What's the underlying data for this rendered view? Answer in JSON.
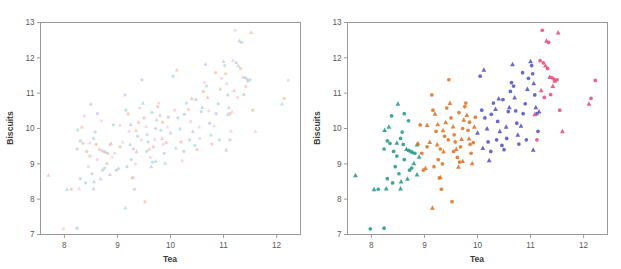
{
  "figure": {
    "background": "#ffffff",
    "frame_color": "#9a9a9a",
    "text_color": "#5a5a5a",
    "panels": [
      {
        "id": "left-panel",
        "name": "unclustered-scatter",
        "marker_style": "faint-multicolor-dots"
      },
      {
        "id": "right-panel",
        "name": "clustered-scatter",
        "marker_style": "solid-colored-circles-and-triangles"
      }
    ]
  },
  "axes": {
    "xlabel": "Tea",
    "ylabel": "Biscuits",
    "xticks": [
      "8",
      "9",
      "10",
      "11",
      "12"
    ],
    "yticks": [
      "7",
      "8",
      "9",
      "10",
      "11",
      "12",
      "13"
    ],
    "xlim": [
      7.55,
      12.45
    ],
    "ylim": [
      7.0,
      13.0
    ]
  },
  "palette": {
    "cluster_green": "#2f9e8f",
    "cluster_orange": "#e07b32",
    "cluster_blue": "#5b5bc4",
    "cluster_pink": "#e8557f",
    "faint_salmon": "#f2a48c",
    "faint_teal": "#8fc9c4",
    "faint_blue": "#a8b4e0",
    "faint_pink": "#f0b9cf"
  },
  "chart_data": {
    "type": "scatter",
    "title": "",
    "xlabel": "Tea",
    "ylabel": "Biscuits",
    "xlim": [
      7.55,
      12.45
    ],
    "ylim": [
      7.0,
      13.0
    ],
    "grid": false,
    "legend": "none",
    "panels": [
      {
        "name": "left",
        "description": "Same points rendered without cluster assignment; faint pastel multicolor small markers",
        "colored_by_cluster": false
      },
      {
        "name": "right",
        "description": "Same points colored by cluster membership; circles and triangles",
        "colored_by_cluster": true
      }
    ],
    "series": [
      {
        "name": "cluster-green",
        "color": "#2f9e8f",
        "faint_color": "#8fc9c4",
        "points": [
          [
            7.7,
            8.68
          ],
          [
            7.98,
            7.16
          ],
          [
            8.24,
            7.18
          ],
          [
            8.05,
            8.28
          ],
          [
            8.13,
            8.28
          ],
          [
            8.28,
            8.3
          ],
          [
            8.24,
            9.42
          ],
          [
            8.3,
            9.65
          ],
          [
            8.33,
            10.05
          ],
          [
            8.38,
            10.36
          ],
          [
            8.5,
            10.7
          ],
          [
            8.55,
            9.72
          ],
          [
            8.42,
            9.35
          ],
          [
            8.48,
            9.6
          ],
          [
            8.52,
            8.72
          ],
          [
            8.56,
            8.5
          ],
          [
            8.6,
            9.55
          ],
          [
            8.62,
            9.12
          ],
          [
            8.55,
            8.3
          ],
          [
            8.4,
            8.46
          ],
          [
            8.66,
            9.42
          ],
          [
            8.7,
            9.38
          ],
          [
            8.74,
            9.35
          ],
          [
            8.78,
            9.33
          ],
          [
            8.82,
            9.3
          ],
          [
            8.86,
            9.55
          ],
          [
            8.72,
            8.82
          ],
          [
            8.76,
            8.88
          ],
          [
            8.8,
            9.02
          ],
          [
            8.45,
            8.92
          ],
          [
            8.68,
            8.58
          ],
          [
            8.58,
            9.9
          ],
          [
            8.35,
            9.58
          ],
          [
            8.9,
            9.2
          ],
          [
            8.62,
            10.42
          ],
          [
            8.25,
            9.96
          ],
          [
            8.48,
            9.22
          ],
          [
            8.7,
            10.22
          ],
          [
            8.86,
            8.7
          ],
          [
            8.3,
            8.58
          ]
        ],
        "shape_mix": "circle+triangle"
      },
      {
        "name": "cluster-orange",
        "color": "#e07b32",
        "faint_color": "#f2a48c",
        "points": [
          [
            8.92,
            10.1
          ],
          [
            8.88,
            9.58
          ],
          [
            8.95,
            9.3
          ],
          [
            8.98,
            8.82
          ],
          [
            9.02,
            8.88
          ],
          [
            9.05,
            9.48
          ],
          [
            9.1,
            9.62
          ],
          [
            9.14,
            10.95
          ],
          [
            9.16,
            10.52
          ],
          [
            9.2,
            10.42
          ],
          [
            9.22,
            9.92
          ],
          [
            9.24,
            9.55
          ],
          [
            9.26,
            9.12
          ],
          [
            9.28,
            8.6
          ],
          [
            9.3,
            8.62
          ],
          [
            9.32,
            8.28
          ],
          [
            9.15,
            7.76
          ],
          [
            9.52,
            7.93
          ],
          [
            9.34,
            9.0
          ],
          [
            9.36,
            9.35
          ],
          [
            9.38,
            9.78
          ],
          [
            9.4,
            10.18
          ],
          [
            9.42,
            10.58
          ],
          [
            9.46,
            11.38
          ],
          [
            9.48,
            10.72
          ],
          [
            9.5,
            10.3
          ],
          [
            9.54,
            10.06
          ],
          [
            9.56,
            9.82
          ],
          [
            9.58,
            9.62
          ],
          [
            9.6,
            9.42
          ],
          [
            9.62,
            9.18
          ],
          [
            9.64,
            8.92
          ],
          [
            9.66,
            9.05
          ],
          [
            9.68,
            9.48
          ],
          [
            9.7,
            9.7
          ],
          [
            9.72,
            10.0
          ],
          [
            9.74,
            10.25
          ],
          [
            9.76,
            10.62
          ],
          [
            9.78,
            10.72
          ],
          [
            9.8,
            10.38
          ],
          [
            9.82,
            9.95
          ],
          [
            9.84,
            9.72
          ],
          [
            9.86,
            9.55
          ],
          [
            9.88,
            9.3
          ],
          [
            9.9,
            9.02
          ],
          [
            9.92,
            9.6
          ],
          [
            9.94,
            10.05
          ],
          [
            9.96,
            10.32
          ],
          [
            9.55,
            9.35
          ],
          [
            9.35,
            9.95
          ],
          [
            9.45,
            9.68
          ],
          [
            9.25,
            10.12
          ],
          [
            9.65,
            10.45
          ],
          [
            9.85,
            10.18
          ],
          [
            9.05,
            10.1
          ],
          [
            9.18,
            8.92
          ],
          [
            9.72,
            9.08
          ],
          [
            9.3,
            9.42
          ]
        ],
        "shape_mix": "circle+triangle"
      },
      {
        "name": "cluster-blue",
        "color": "#5b5bc4",
        "faint_color": "#a8b4e0",
        "points": [
          [
            10.0,
            9.88
          ],
          [
            10.05,
            11.48
          ],
          [
            10.12,
            11.66
          ],
          [
            10.08,
            10.52
          ],
          [
            10.14,
            10.3
          ],
          [
            10.18,
            10.0
          ],
          [
            10.2,
            9.62
          ],
          [
            10.22,
            9.1
          ],
          [
            10.26,
            10.4
          ],
          [
            10.3,
            10.72
          ],
          [
            10.34,
            10.55
          ],
          [
            10.38,
            10.2
          ],
          [
            10.42,
            9.92
          ],
          [
            10.46,
            9.52
          ],
          [
            10.5,
            9.4
          ],
          [
            10.54,
            10.05
          ],
          [
            10.58,
            10.48
          ],
          [
            10.6,
            10.6
          ],
          [
            10.62,
            11.05
          ],
          [
            10.64,
            11.3
          ],
          [
            10.66,
            11.82
          ],
          [
            10.68,
            11.2
          ],
          [
            10.7,
            10.88
          ],
          [
            10.72,
            10.5
          ],
          [
            10.74,
            10.15
          ],
          [
            10.76,
            9.82
          ],
          [
            10.78,
            9.56
          ],
          [
            10.82,
            10.08
          ],
          [
            10.86,
            10.42
          ],
          [
            10.9,
            10.7
          ],
          [
            10.94,
            11.12
          ],
          [
            10.96,
            11.42
          ],
          [
            11.0,
            11.9
          ],
          [
            11.02,
            11.78
          ],
          [
            11.04,
            11.55
          ],
          [
            11.06,
            11.28
          ],
          [
            11.08,
            10.95
          ],
          [
            11.1,
            10.6
          ],
          [
            11.12,
            10.42
          ],
          [
            11.14,
            9.92
          ],
          [
            11.05,
            9.4
          ],
          [
            10.92,
            9.68
          ],
          [
            10.4,
            10.85
          ],
          [
            10.55,
            9.72
          ],
          [
            10.25,
            9.35
          ],
          [
            10.1,
            9.45
          ],
          [
            10.85,
            11.58
          ],
          [
            11.16,
            10.48
          ],
          [
            10.48,
            10.82
          ],
          [
            10.36,
            9.68
          ]
        ],
        "shape_mix": "circle+triangle"
      },
      {
        "name": "cluster-pink",
        "color": "#e8557f",
        "faint_color": "#f0b9cf",
        "points": [
          [
            11.22,
            12.78
          ],
          [
            11.3,
            12.48
          ],
          [
            11.34,
            12.44
          ],
          [
            11.52,
            12.72
          ],
          [
            11.18,
            11.92
          ],
          [
            11.24,
            11.86
          ],
          [
            11.28,
            11.78
          ],
          [
            11.32,
            11.7
          ],
          [
            11.36,
            11.46
          ],
          [
            11.4,
            11.44
          ],
          [
            11.44,
            11.4
          ],
          [
            11.2,
            11.08
          ],
          [
            11.26,
            10.88
          ],
          [
            11.46,
            11.35
          ],
          [
            11.5,
            11.38
          ],
          [
            11.55,
            10.52
          ],
          [
            11.6,
            9.92
          ],
          [
            11.12,
            9.68
          ],
          [
            12.1,
            10.7
          ],
          [
            12.14,
            10.85
          ],
          [
            12.22,
            11.36
          ],
          [
            11.08,
            10.4
          ],
          [
            11.38,
            10.96
          ],
          [
            11.42,
            11.2
          ]
        ],
        "shape_mix": "circle+triangle"
      }
    ]
  }
}
